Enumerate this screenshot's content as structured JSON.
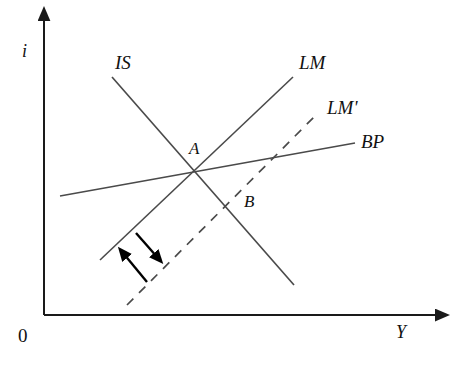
{
  "figure": {
    "background_color": "#ffffff",
    "line_color": "#4a4a4a",
    "axis_color": "#1a1a1a",
    "text_color": "#111111",
    "width": 466,
    "height": 366
  },
  "axes": {
    "vertical": {
      "label": "i",
      "label_x": 22,
      "label_y": 42,
      "x": 44,
      "y_top": 13,
      "y_bottom": 315
    },
    "horizontal": {
      "label": "Y",
      "label_x": 396,
      "label_y": 323,
      "y": 315,
      "x_left": 44,
      "x_right": 445
    },
    "origin": {
      "label": "0",
      "label_x": 18,
      "label_y": 326
    }
  },
  "curves": [
    {
      "name": "IS",
      "label": "IS",
      "label_x": 115,
      "label_y": 53,
      "style": "solid",
      "x1": 112,
      "y1": 77,
      "x2": 294,
      "y2": 285
    },
    {
      "name": "LM",
      "label": "LM",
      "label_x": 299,
      "label_y": 53,
      "style": "solid",
      "x1": 100,
      "y1": 260,
      "x2": 293,
      "y2": 77
    },
    {
      "name": "LM'",
      "label": "LM'",
      "label_x": 327,
      "label_y": 98,
      "style": "dashed",
      "x1": 127,
      "y1": 305,
      "x2": 318,
      "y2": 113
    },
    {
      "name": "BP",
      "label": "BP",
      "label_x": 361,
      "label_y": 132,
      "style": "solid",
      "x1": 60,
      "y1": 196,
      "x2": 355,
      "y2": 143
    }
  ],
  "points": [
    {
      "name": "A",
      "label": "A",
      "x": 197,
      "y": 169,
      "label_x": 189,
      "label_y": 140,
      "description": "intersection of IS, LM and BP"
    },
    {
      "name": "B",
      "label": "B",
      "x": 238,
      "y": 202,
      "label_x": 244,
      "label_y": 193,
      "description": "intersection of IS and LM'"
    }
  ],
  "shift_arrows": [
    {
      "name": "lm-shift-right-arrow",
      "direction": "down-right",
      "x1": 136,
      "y1": 233,
      "x2": 158,
      "y2": 258
    },
    {
      "name": "lm-shift-left-arrow",
      "direction": "up-left",
      "x1": 147,
      "y1": 282,
      "x2": 123,
      "y2": 253
    }
  ],
  "chart_data": {
    "type": "line",
    "xlabel": "Y",
    "ylabel": "i",
    "grid": false,
    "legend": "inline-curve-labels",
    "series": [
      {
        "name": "IS",
        "style": "solid",
        "slope": "negative",
        "points": [
          [
            112,
            77
          ],
          [
            294,
            285
          ]
        ]
      },
      {
        "name": "LM",
        "style": "solid",
        "slope": "positive",
        "points": [
          [
            100,
            260
          ],
          [
            293,
            77
          ]
        ]
      },
      {
        "name": "LM'",
        "style": "dashed",
        "slope": "positive",
        "points": [
          [
            127,
            305
          ],
          [
            318,
            113
          ]
        ]
      },
      {
        "name": "BP",
        "style": "solid",
        "slope": "slightly positive",
        "points": [
          [
            60,
            196
          ],
          [
            355,
            143
          ]
        ]
      }
    ],
    "annotations": [
      {
        "label": "A",
        "x": 197,
        "y": 169
      },
      {
        "label": "B",
        "x": 238,
        "y": 202
      },
      {
        "label": "0",
        "x": 44,
        "y": 315
      }
    ]
  }
}
